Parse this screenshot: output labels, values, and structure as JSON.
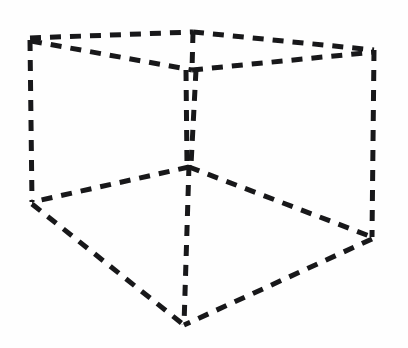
{
  "figure": {
    "canvas": {
      "width": 408,
      "height": 348
    },
    "background_color": "#fefefe",
    "line_color": "#18181a",
    "line_style": "dashed",
    "stroke_width": 5,
    "dash_pattern": "11 9",
    "vertices": {
      "top_back_left": {
        "name": "top-back-left",
        "x": 30,
        "y": 38
      },
      "top_back_center": {
        "name": "top-back-center",
        "x": 193,
        "y": 32
      },
      "top_back_right": {
        "name": "top-back-right",
        "x": 374,
        "y": 50
      },
      "top_front_center": {
        "name": "top-front-center",
        "x": 192,
        "y": 70
      },
      "mid_center": {
        "name": "mid-center",
        "x": 189,
        "y": 165
      },
      "bottom_left": {
        "name": "bottom-left",
        "x": 32,
        "y": 202
      },
      "bottom_right": {
        "name": "bottom-right",
        "x": 372,
        "y": 237
      },
      "bottom_front": {
        "name": "bottom-front",
        "x": 184,
        "y": 325
      }
    },
    "edges": [
      {
        "id": "top-back-left-edge",
        "from": "top_back_left",
        "to": "top_back_center",
        "d": "M30,38 L193,32"
      },
      {
        "id": "top-back-right-edge",
        "from": "top_back_center",
        "to": "top_back_right",
        "d": "M193,32 L374,50"
      },
      {
        "id": "top-front-left-edge",
        "from": "top_back_left",
        "to": "top_front_center",
        "d": "M31,41 L192,70"
      },
      {
        "id": "top-front-right-edge",
        "from": "top_front_center",
        "to": "top_back_right",
        "d": "M192,70 L374,52"
      },
      {
        "id": "vertical-back-center-edge",
        "from": "top_back_center",
        "to": "top_front_center",
        "d": "M193,32 L192,70"
      },
      {
        "id": "vertical-center-left-edge",
        "from": "top_front_center",
        "to": "mid_center",
        "d": "M186,70 L187,165"
      },
      {
        "id": "vertical-center-right-edge",
        "from": "top_front_center",
        "to": "mid_center",
        "d": "M196,70 L191,165"
      },
      {
        "id": "vertical-left-edge",
        "from": "top_back_left",
        "to": "bottom_left",
        "d": "M30,40 L32,202"
      },
      {
        "id": "vertical-right-edge",
        "from": "top_back_right",
        "to": "bottom_right",
        "d": "M374,50 L372,237"
      },
      {
        "id": "vertical-front-edge",
        "from": "mid_center",
        "to": "bottom_front",
        "d": "M189,165 L184,325"
      },
      {
        "id": "floor-back-left-edge",
        "from": "mid_center",
        "to": "bottom_left",
        "d": "M189,167 L32,202"
      },
      {
        "id": "floor-back-right-edge",
        "from": "mid_center",
        "to": "bottom_right",
        "d": "M189,167 L372,237"
      },
      {
        "id": "floor-front-left-edge",
        "from": "bottom_left",
        "to": "bottom_front",
        "d": "M32,204 L184,325"
      },
      {
        "id": "floor-front-right-edge",
        "from": "bottom_right",
        "to": "bottom_front",
        "d": "M372,239 L184,325"
      }
    ]
  }
}
